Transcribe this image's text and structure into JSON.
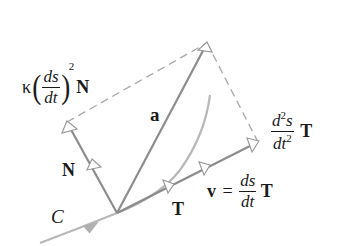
{
  "figure": {
    "colors": {
      "vector": "#8c8c8c",
      "dashed": "#a8a8a8",
      "curve": "#b4b4b4",
      "text": "#1a1a1a",
      "background": "#ffffff"
    },
    "labels": {
      "normal_component": {
        "kappa": "κ",
        "frac_num": "ds",
        "frac_den": "dt",
        "power": "2",
        "vector": "N"
      },
      "acceleration": "a",
      "tangential_component": {
        "frac_num": "d",
        "frac_num_sup": "2",
        "frac_num_tail": "s",
        "frac_den": "dt",
        "frac_den_sup": "2",
        "vector": "T"
      },
      "unit_normal": "N",
      "unit_tangent": "T",
      "velocity": {
        "lhs": "v",
        "equals": "=",
        "frac_num": "ds",
        "frac_den": "dt",
        "vector": "T"
      },
      "curve": "C"
    },
    "points": {
      "origin": [
        117,
        213
      ],
      "acceleration_tip": [
        207,
        43
      ],
      "normal_component_tip": [
        67,
        122
      ],
      "tangential_component_tip": [
        258,
        142
      ]
    }
  }
}
